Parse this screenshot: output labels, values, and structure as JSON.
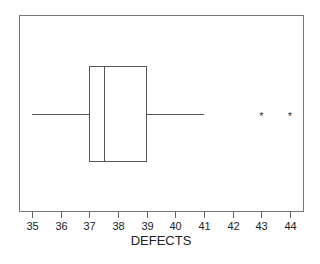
{
  "chart_data": {
    "type": "boxplot",
    "title": "",
    "xlabel": "DEFECTS",
    "ylabel": "",
    "orientation": "horizontal",
    "xlim": [
      34.55,
      44.45
    ],
    "ticks": [
      35,
      36,
      37,
      38,
      39,
      40,
      41,
      42,
      43,
      44
    ],
    "tick_labels": [
      "35",
      "36",
      "37",
      "38",
      "39",
      "40",
      "41",
      "42",
      "43",
      "44"
    ],
    "grid": false,
    "legend": null,
    "box": {
      "whisker_low": 35,
      "q1": 37,
      "median": 37.5,
      "q3": 39,
      "whisker_high": 41,
      "outliers": [
        43,
        44
      ]
    },
    "outlier_marker": "*"
  },
  "colors": {
    "frame": "#666666",
    "box": "#555555",
    "text": "#222222"
  }
}
